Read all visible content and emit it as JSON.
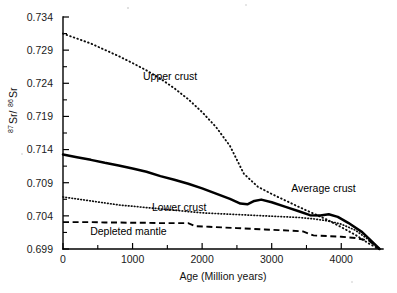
{
  "chart_data": {
    "type": "line",
    "title": "",
    "xlabel": "Age (Million years)",
    "ylabel": "87Sr/86Sr",
    "ylabel_parts": {
      "sup1": "87",
      "mid": "Sr/",
      "sup2": "86",
      "tail": "Sr"
    },
    "xlim": [
      0,
      4600
    ],
    "ylim": [
      0.699,
      0.734
    ],
    "xticks": [
      0,
      1000,
      2000,
      3000,
      4000
    ],
    "xtick_labels": [
      "0",
      "1000",
      "2000",
      "3000",
      "4000"
    ],
    "xticks_minor": [
      500,
      1500,
      2500,
      3500,
      4500
    ],
    "yticks": [
      0.699,
      0.704,
      0.709,
      0.714,
      0.719,
      0.724,
      0.729,
      0.734
    ],
    "ytick_labels": [
      "0.699",
      "0.704",
      "0.709",
      "0.714",
      "0.719",
      "0.724",
      "0.729",
      "0.734"
    ],
    "grid": false,
    "legend_position": "inline-annotations",
    "series": [
      {
        "name": "Upper crust",
        "style": "dotted-coarse",
        "label_x": 1150,
        "label_y": 0.7245,
        "x": [
          0,
          200,
          400,
          600,
          800,
          1000,
          1200,
          1400,
          1600,
          1800,
          2000,
          2200,
          2400,
          2600,
          2800,
          3000,
          3200,
          3400,
          3600,
          3800,
          4000,
          4200,
          4400,
          4550
        ],
        "y": [
          0.7315,
          0.73075,
          0.73,
          0.72905,
          0.7281,
          0.72705,
          0.72595,
          0.7247,
          0.72325,
          0.7216,
          0.71965,
          0.7174,
          0.71455,
          0.71035,
          0.7084,
          0.7073,
          0.7063,
          0.7053,
          0.70435,
          0.7034,
          0.7023,
          0.70115,
          0.6998,
          0.699
        ]
      },
      {
        "name": "Average crust",
        "style": "solid-thick",
        "label_x": 3280,
        "label_y": 0.70755,
        "x": [
          0,
          200,
          400,
          600,
          800,
          1000,
          1200,
          1400,
          1600,
          1800,
          2000,
          2200,
          2400,
          2550,
          2650,
          2750,
          2850,
          3000,
          3200,
          3400,
          3550,
          3700,
          3820,
          3950,
          4100,
          4300,
          4450,
          4550
        ],
        "y": [
          0.71325,
          0.71285,
          0.71245,
          0.712,
          0.7116,
          0.71115,
          0.71065,
          0.71,
          0.70945,
          0.70885,
          0.70815,
          0.70735,
          0.70655,
          0.70585,
          0.70575,
          0.70625,
          0.70645,
          0.70605,
          0.70535,
          0.70465,
          0.7041,
          0.70405,
          0.70425,
          0.70385,
          0.70295,
          0.70155,
          0.70005,
          0.699
        ]
      },
      {
        "name": "Lower crust",
        "style": "dotted-fine",
        "label_x": 1280,
        "label_y": 0.70475,
        "x": [
          0,
          200,
          400,
          600,
          800,
          1000,
          1200,
          1400,
          1600,
          1800,
          2000,
          2200,
          2400,
          2600,
          2800,
          3000,
          3200,
          3400,
          3600,
          3800,
          4000,
          4200,
          4400,
          4550
        ],
        "y": [
          0.70685,
          0.70655,
          0.70625,
          0.70595,
          0.70565,
          0.70545,
          0.70525,
          0.70505,
          0.70485,
          0.70465,
          0.70445,
          0.70435,
          0.70425,
          0.70415,
          0.70405,
          0.70395,
          0.70385,
          0.70375,
          0.70355,
          0.70325,
          0.70275,
          0.70185,
          0.70035,
          0.699
        ]
      },
      {
        "name": "Depleted mantle",
        "style": "dashed",
        "label_x": 390,
        "label_y": 0.70105,
        "x": [
          0,
          200,
          400,
          600,
          800,
          1000,
          1200,
          1400,
          1600,
          1800,
          1900,
          2100,
          2300,
          2500,
          2700,
          2900,
          3100,
          3300,
          3450,
          3600,
          3800,
          4000,
          4200,
          4400,
          4550
        ],
        "y": [
          0.70305,
          0.70305,
          0.70305,
          0.703,
          0.703,
          0.70295,
          0.70295,
          0.7029,
          0.7029,
          0.7029,
          0.70245,
          0.70235,
          0.70225,
          0.70215,
          0.70205,
          0.70195,
          0.70185,
          0.70175,
          0.70165,
          0.70105,
          0.70095,
          0.70085,
          0.70065,
          0.70025,
          0.699
        ]
      }
    ]
  }
}
